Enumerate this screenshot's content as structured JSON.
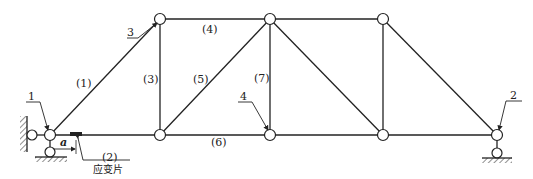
{
  "diagram": {
    "type": "truss",
    "stroke_color": "#222222",
    "member_labels": {
      "m1": "(1)",
      "m2": "(2)",
      "m3": "(3)",
      "m4": "(4)",
      "m5": "(5)",
      "m6": "(6)",
      "m7": "(7)"
    },
    "callouts": {
      "c1": "1",
      "c2": "2",
      "c3": "3",
      "c4": "4"
    },
    "dimension_label": "a",
    "strain_gauge_label": "应变片"
  }
}
